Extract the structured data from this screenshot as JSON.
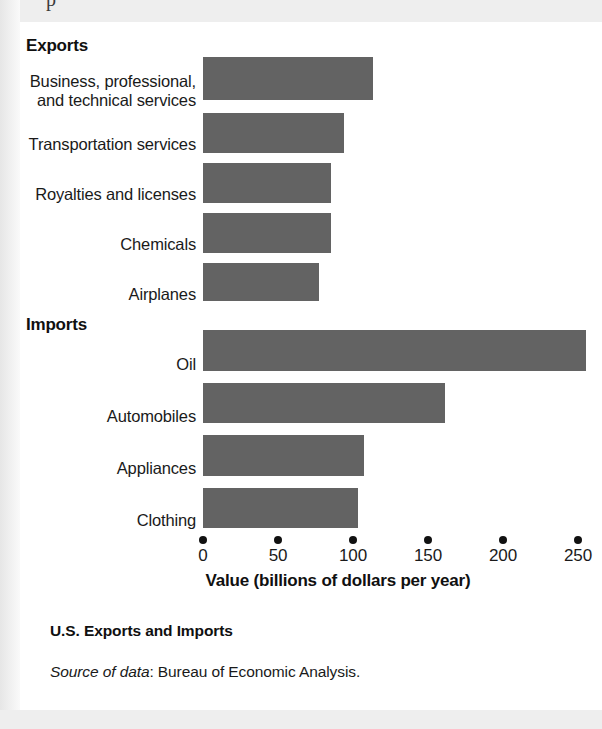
{
  "figure": {
    "caption": "U.S. Exports and Imports",
    "source_prefix": "Source of data",
    "source_text": ": Bureau of Economic Analysis.",
    "cropped_top_glyph": "p",
    "bar_color": "#636363",
    "text_color": "#1a1a1a"
  },
  "chart_data": {
    "type": "bar",
    "orientation": "horizontal",
    "title": "U.S. Exports and Imports",
    "xlabel": "Value (billions of dollars per year)",
    "ylabel": "",
    "xlim": [
      0,
      250
    ],
    "xticks": [
      0,
      50,
      100,
      150,
      200,
      250
    ],
    "xtick_labels": [
      "0",
      "50",
      "100",
      "150",
      "200",
      "250"
    ],
    "grid": false,
    "legend": false,
    "tick_marker_style": "dot",
    "groups": [
      {
        "name": "Exports",
        "categories": [
          "Business, professional,\nand technical services",
          "Transportation services",
          "Royalties and licenses",
          "Chemicals",
          "Airplanes"
        ],
        "values": [
          113,
          94,
          85,
          85,
          77
        ]
      },
      {
        "name": "Imports",
        "categories": [
          "Oil",
          "Automobiles",
          "Appliances",
          "Clothing"
        ],
        "values": [
          255,
          161,
          107,
          103
        ]
      }
    ],
    "categories": [
      "Business, professional, and technical services",
      "Transportation services",
      "Royalties and licenses",
      "Chemicals",
      "Airplanes",
      "Oil",
      "Automobiles",
      "Appliances",
      "Clothing"
    ],
    "values": [
      113,
      94,
      85,
      85,
      77,
      255,
      161,
      107,
      103
    ],
    "units": "billions of dollars per year"
  }
}
